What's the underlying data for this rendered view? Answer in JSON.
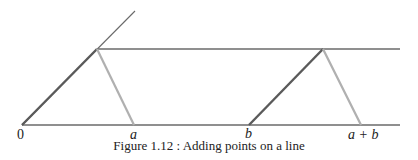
{
  "figure": {
    "caption": "Figure 1.12 : Adding points on a line",
    "labels": {
      "origin": "0",
      "a": "a",
      "b": "b",
      "a_plus_b": "a + b"
    },
    "colors": {
      "dark_line": "#5a5a5a",
      "light_line": "#b0b0b0",
      "thin_line": "#6a6a6a"
    }
  }
}
